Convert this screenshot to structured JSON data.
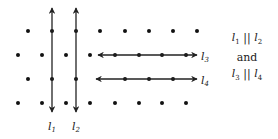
{
  "diagram": {
    "dot_color": "#111111",
    "line_color": "#222222",
    "dots": [
      [
        28,
        31
      ],
      [
        52,
        31
      ],
      [
        76,
        31
      ],
      [
        100,
        31
      ],
      [
        125,
        31
      ],
      [
        149,
        31
      ],
      [
        173,
        31
      ],
      [
        197,
        31
      ],
      [
        18,
        55
      ],
      [
        42,
        55
      ],
      [
        66,
        55
      ],
      [
        90,
        55
      ],
      [
        115,
        55
      ],
      [
        139,
        55
      ],
      [
        162,
        55
      ],
      [
        186,
        55
      ],
      [
        28,
        79
      ],
      [
        52,
        79
      ],
      [
        76,
        79
      ],
      [
        125,
        79
      ],
      [
        149,
        79
      ],
      [
        173,
        79
      ],
      [
        18,
        103
      ],
      [
        42,
        103
      ],
      [
        66,
        103
      ],
      [
        90,
        103
      ],
      [
        115,
        103
      ],
      [
        139,
        103
      ],
      [
        162,
        103
      ],
      [
        186,
        103
      ]
    ],
    "lines": [
      {
        "name": "l1",
        "x1": 52,
        "y1": 8,
        "x2": 52,
        "y2": 112,
        "label": "l",
        "sub": "1",
        "lx": 48,
        "ly": 130
      },
      {
        "name": "l2",
        "x1": 76,
        "y1": 8,
        "x2": 76,
        "y2": 112,
        "label": "l",
        "sub": "2",
        "lx": 72,
        "ly": 130
      },
      {
        "name": "l3",
        "x1": 98,
        "y1": 55,
        "x2": 197,
        "y2": 55,
        "label": "l",
        "sub": "3",
        "lx": 201,
        "ly": 60
      },
      {
        "name": "l4",
        "x1": 96,
        "y1": 79,
        "x2": 197,
        "y2": 79,
        "label": "l",
        "sub": "4",
        "lx": 201,
        "ly": 84
      }
    ]
  },
  "note": {
    "line1_a": "l",
    "line1_a_sub": "1",
    "line1_sym": " || ",
    "line1_b": "l",
    "line1_b_sub": "2",
    "line2": "and",
    "line3_a": "l",
    "line3_a_sub": "3",
    "line3_sym": " || ",
    "line3_b": "l",
    "line3_b_sub": "4"
  }
}
